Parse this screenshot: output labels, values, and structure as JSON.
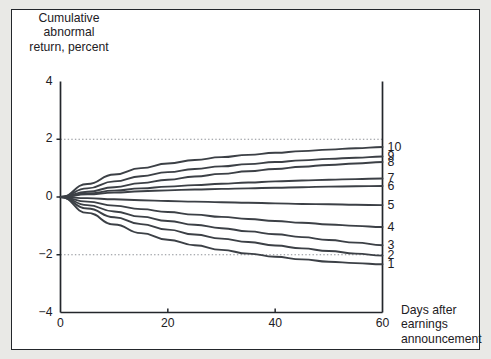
{
  "figure": {
    "y_axis_title": "Cumulative\nabnormal\nreturn, percent",
    "x_axis_title": "Days after\nearnings\nannouncement",
    "frame_color": "#23262b",
    "curve_color": "#3c4046",
    "gridline_color": "#8d9096",
    "background_color": "#ffffff",
    "page_color": "#e9e9e6"
  },
  "axes": {
    "y_ticks": [
      "4",
      "2",
      "0",
      "-2",
      "-4"
    ],
    "x_ticks": [
      "0",
      "20",
      "40",
      "60"
    ]
  },
  "chart_data": {
    "type": "line",
    "title": "",
    "subtitle": "",
    "xlabel": "Days after earnings announcement",
    "ylabel": "Cumulative abnormal return, percent",
    "xlim": [
      0,
      60
    ],
    "ylim": [
      -4,
      4
    ],
    "xticks": [
      0,
      20,
      40,
      60
    ],
    "yticks": [
      -4,
      -2,
      0,
      2,
      4
    ],
    "grid": "dotted horizontal gridlines at y = 2 and y = -2",
    "legend": "series labelled 1-10 at right end of each curve",
    "x": [
      0,
      5,
      10,
      15,
      20,
      25,
      30,
      35,
      40,
      45,
      50,
      55,
      60
    ],
    "series": [
      {
        "name": "10",
        "label": "10",
        "values": [
          0.0,
          0.45,
          0.78,
          1.0,
          1.16,
          1.28,
          1.38,
          1.46,
          1.53,
          1.59,
          1.64,
          1.69,
          1.73
        ],
        "end_value": 1.73
      },
      {
        "name": "9",
        "label": "9",
        "values": [
          0.0,
          0.3,
          0.54,
          0.72,
          0.86,
          0.97,
          1.06,
          1.14,
          1.21,
          1.27,
          1.32,
          1.36,
          1.4
        ],
        "end_value": 1.4
      },
      {
        "name": "8",
        "label": "8",
        "values": [
          0.0,
          0.18,
          0.34,
          0.48,
          0.6,
          0.71,
          0.8,
          0.89,
          0.97,
          1.05,
          1.11,
          1.16,
          1.21
        ],
        "end_value": 1.21
      },
      {
        "name": "7",
        "label": "7",
        "values": [
          0.0,
          0.12,
          0.22,
          0.3,
          0.36,
          0.41,
          0.46,
          0.5,
          0.54,
          0.57,
          0.6,
          0.62,
          0.64
        ],
        "end_value": 0.64
      },
      {
        "name": "6",
        "label": "6",
        "values": [
          0.0,
          0.09,
          0.15,
          0.2,
          0.23,
          0.26,
          0.28,
          0.3,
          0.32,
          0.34,
          0.36,
          0.37,
          0.38
        ],
        "end_value": 0.38
      },
      {
        "name": "5",
        "label": "5",
        "values": [
          0.0,
          -0.04,
          -0.08,
          -0.11,
          -0.14,
          -0.16,
          -0.18,
          -0.2,
          -0.22,
          -0.24,
          -0.25,
          -0.27,
          -0.28
        ],
        "end_value": -0.28
      },
      {
        "name": "4",
        "label": "4",
        "values": [
          0.0,
          -0.16,
          -0.3,
          -0.42,
          -0.52,
          -0.61,
          -0.69,
          -0.76,
          -0.83,
          -0.89,
          -0.95,
          -1.0,
          -1.04
        ],
        "end_value": -1.04
      },
      {
        "name": "3",
        "label": "3",
        "values": [
          0.0,
          -0.28,
          -0.5,
          -0.68,
          -0.83,
          -0.96,
          -1.08,
          -1.19,
          -1.29,
          -1.39,
          -1.49,
          -1.58,
          -1.67
        ],
        "end_value": -1.67
      },
      {
        "name": "2",
        "label": "2",
        "values": [
          0.0,
          -0.4,
          -0.7,
          -0.94,
          -1.13,
          -1.3,
          -1.44,
          -1.56,
          -1.68,
          -1.78,
          -1.87,
          -1.96,
          -2.03
        ],
        "end_value": -2.03
      },
      {
        "name": "1",
        "label": "1",
        "values": [
          0.0,
          -0.55,
          -0.95,
          -1.25,
          -1.48,
          -1.67,
          -1.83,
          -1.96,
          -2.07,
          -2.16,
          -2.24,
          -2.29,
          -2.33
        ],
        "end_value": -2.33
      }
    ]
  }
}
